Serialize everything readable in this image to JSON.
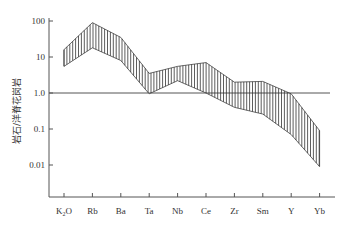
{
  "chart_data": {
    "type": "area",
    "title": "",
    "xlabel": "",
    "ylabel": "岩石/洋脊花岗岩",
    "yscale": "log",
    "ylim": [
      0.001,
      100
    ],
    "yticks": [
      {
        "value": 100,
        "label": "100"
      },
      {
        "value": 10,
        "label": "10"
      },
      {
        "value": 1,
        "label": "1.0"
      },
      {
        "value": 0.1,
        "label": "0.1"
      },
      {
        "value": 0.01,
        "label": "0.01"
      }
    ],
    "categories": [
      "K2O",
      "Rb",
      "Ba",
      "Ta",
      "Nb",
      "Ce",
      "Zr",
      "Sm",
      "Y",
      "Yb"
    ],
    "category_labels": [
      {
        "main": "K",
        "sub": "2",
        "tail": "O"
      },
      {
        "main": "Rb"
      },
      {
        "main": "Ba"
      },
      {
        "main": "Ta"
      },
      {
        "main": "Nb"
      },
      {
        "main": "Ce"
      },
      {
        "main": "Zr"
      },
      {
        "main": "Sm"
      },
      {
        "main": "Y"
      },
      {
        "main": "Yb"
      }
    ],
    "series": [
      {
        "name": "upper",
        "values": [
          16,
          90,
          35,
          3.5,
          5.5,
          7,
          2,
          2.1,
          0.95,
          0.09
        ]
      },
      {
        "name": "lower",
        "values": [
          5.5,
          18,
          8,
          0.95,
          2.2,
          1,
          0.4,
          0.26,
          0.07,
          0.009
        ]
      }
    ],
    "reference_line": {
      "value": 1.0
    },
    "fill": "vertical-hatch",
    "grid": false,
    "legend": "none"
  }
}
